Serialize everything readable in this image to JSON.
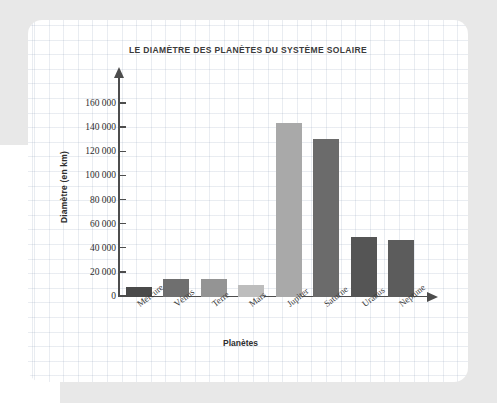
{
  "chart_data": {
    "type": "bar",
    "title": "LE DIAMÈTRE DES PLANÈTES DU SYSTÈME SOLAIRE",
    "xlabel": "Planètes",
    "ylabel": "Diamètre (en km)",
    "categories": [
      "Mercure",
      "Vénus",
      "Terre",
      "Mars",
      "Jupiter",
      "Saturne",
      "Uranus",
      "Neptune"
    ],
    "values": [
      8000,
      15000,
      15000,
      10000,
      144000,
      131000,
      50000,
      47000
    ],
    "colors": [
      "#4a4a4a",
      "#6f6f6f",
      "#949494",
      "#bdbdbd",
      "#a9a9a9",
      "#6b6b6b",
      "#555555",
      "#5c5c5c"
    ],
    "ylim": [
      0,
      170000
    ],
    "yticks": [
      0,
      20000,
      40000,
      60000,
      80000,
      100000,
      120000,
      140000,
      160000
    ],
    "ytick_labels": [
      "0",
      "20 000",
      "40 000",
      "60 000",
      "80 000",
      "100 000",
      "120 000",
      "140 000",
      "160 000"
    ],
    "grid": true,
    "legend": null
  }
}
